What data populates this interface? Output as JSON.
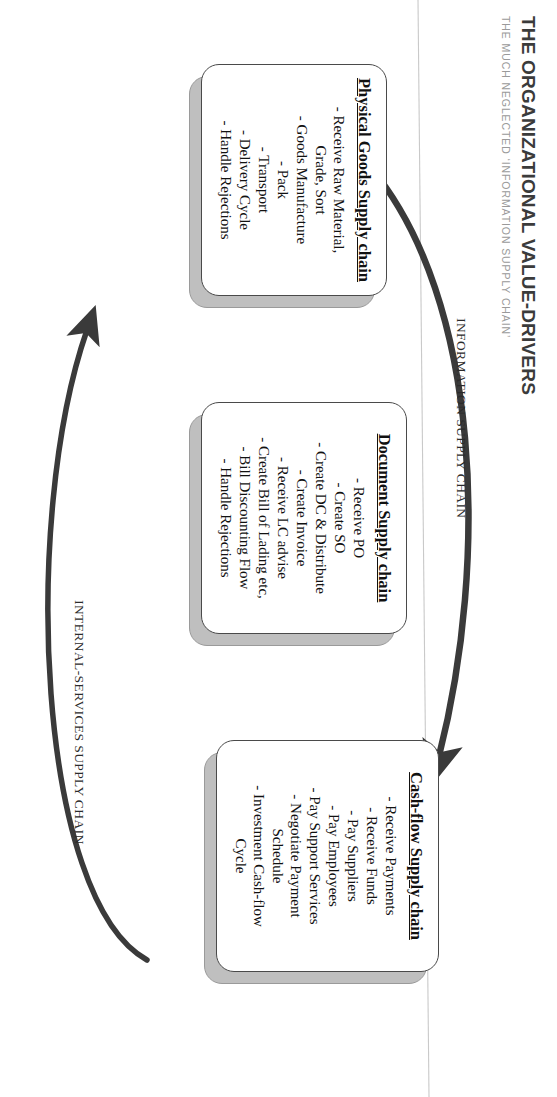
{
  "header": {
    "title": "THE ORGANIZATIONAL VALUE-DRIVERS",
    "subtitle": "THE MUCH NEGLECTED ‘INFORMATION SUPPLY CHAIN’"
  },
  "chain_labels": {
    "information": "INFORMATION SUPPLY CHAIN",
    "internal_services": "INTERNAL-SERVICES SUPPLY CHAIN"
  },
  "boxes": [
    {
      "id": "physical-goods-supply-chain",
      "title": "Physical Goods Supply\nchain",
      "items": [
        "- Receive Raw Material,\nGrade, Sort",
        "- Goods Manufacture",
        "- Pack",
        "- Transport",
        "- Delivery Cycle",
        "- Handle Rejections"
      ]
    },
    {
      "id": "document-supply-chain",
      "title": "Document Supply\nchain",
      "items": [
        "- Receive PO",
        "- Create SO",
        "- Create DC & Distribute",
        "- Create Invoice",
        "- Receive LC advise",
        "- Create Bill of Lading etc,",
        "- Bill Discounting Flow",
        "- Handle Rejections"
      ]
    },
    {
      "id": "cash-flow-supply-chain",
      "title": "Cash-flow Supply chain",
      "items": [
        "- Receive Payments",
        "- Receive Funds",
        "- Pay Suppliers",
        "- Pay Employees",
        "- Pay Support Services",
        "- Negotiate Payment\nSchedule",
        "- Investment Cash-flow\nCycle"
      ]
    }
  ],
  "colors": {
    "title": "#3b3b3b",
    "subtitle": "#9a9a9a",
    "box_border": "#4a4a4a",
    "box_shadow": "#bfbfbf",
    "arrow": "#3a3a3a",
    "text": "#111111"
  }
}
